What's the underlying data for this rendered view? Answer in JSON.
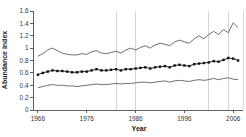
{
  "chart_data": {
    "type": "line",
    "title": "",
    "xlabel": "Year",
    "ylabel": "Abundance index",
    "xlim": [
      1965,
      2008
    ],
    "ylim": [
      0,
      1.6
    ],
    "grid": "vertical-reference-lines-only",
    "legend_position": "none",
    "x_ticks": [
      1966,
      1976,
      1986,
      1996,
      2006
    ],
    "y_ticks": [
      0,
      0.2,
      0.4,
      0.6,
      0.8,
      1,
      1.2,
      1.4,
      1.6
    ],
    "y_tick_labels": [
      "0",
      "0.2",
      "0.4",
      "0.6",
      "0.8",
      "1",
      "1.2",
      "1.4",
      "1.6"
    ],
    "grid_vlines_years": [
      1982,
      1986,
      2001,
      2005
    ],
    "x": [
      1966,
      1967,
      1968,
      1969,
      1970,
      1971,
      1972,
      1973,
      1974,
      1975,
      1976,
      1977,
      1978,
      1979,
      1980,
      1981,
      1982,
      1983,
      1984,
      1985,
      1986,
      1987,
      1988,
      1989,
      1990,
      1991,
      1992,
      1993,
      1994,
      1995,
      1996,
      1997,
      1998,
      1999,
      2000,
      2001,
      2002,
      2003,
      2004,
      2005,
      2006,
      2007
    ],
    "series": [
      {
        "name": "upper-confidence-limit",
        "style": "line",
        "color": "#4a4a4a",
        "values": [
          0.87,
          0.91,
          0.97,
          1.0,
          0.96,
          0.92,
          0.9,
          0.89,
          0.89,
          0.91,
          0.9,
          0.94,
          0.96,
          0.92,
          0.91,
          0.93,
          0.95,
          0.92,
          0.97,
          1.0,
          0.97,
          1.01,
          1.04,
          1.0,
          1.05,
          1.08,
          1.06,
          1.04,
          1.1,
          1.13,
          1.1,
          1.08,
          1.15,
          1.2,
          1.15,
          1.22,
          1.27,
          1.22,
          1.3,
          1.25,
          1.41,
          1.33
        ]
      },
      {
        "name": "abundance-index-mean",
        "style": "line+markers",
        "color": "#111111",
        "values": [
          0.57,
          0.6,
          0.62,
          0.64,
          0.63,
          0.63,
          0.62,
          0.61,
          0.61,
          0.62,
          0.62,
          0.64,
          0.66,
          0.64,
          0.64,
          0.65,
          0.66,
          0.64,
          0.66,
          0.66,
          0.67,
          0.68,
          0.69,
          0.67,
          0.69,
          0.7,
          0.71,
          0.69,
          0.72,
          0.73,
          0.72,
          0.71,
          0.74,
          0.75,
          0.76,
          0.77,
          0.79,
          0.78,
          0.81,
          0.84,
          0.83,
          0.8
        ]
      },
      {
        "name": "lower-confidence-limit",
        "style": "line",
        "color": "#4a4a4a",
        "values": [
          0.36,
          0.38,
          0.4,
          0.41,
          0.4,
          0.4,
          0.39,
          0.39,
          0.38,
          0.39,
          0.4,
          0.41,
          0.42,
          0.41,
          0.41,
          0.42,
          0.43,
          0.42,
          0.43,
          0.43,
          0.44,
          0.45,
          0.45,
          0.44,
          0.45,
          0.46,
          0.47,
          0.45,
          0.47,
          0.48,
          0.47,
          0.46,
          0.48,
          0.49,
          0.48,
          0.49,
          0.51,
          0.49,
          0.51,
          0.52,
          0.5,
          0.49
        ]
      }
    ],
    "colors": {
      "background": "#ffffff",
      "axis": "#606060",
      "grid": "#cccccc",
      "right_border": "#cccccc",
      "text": "#333333"
    }
  }
}
